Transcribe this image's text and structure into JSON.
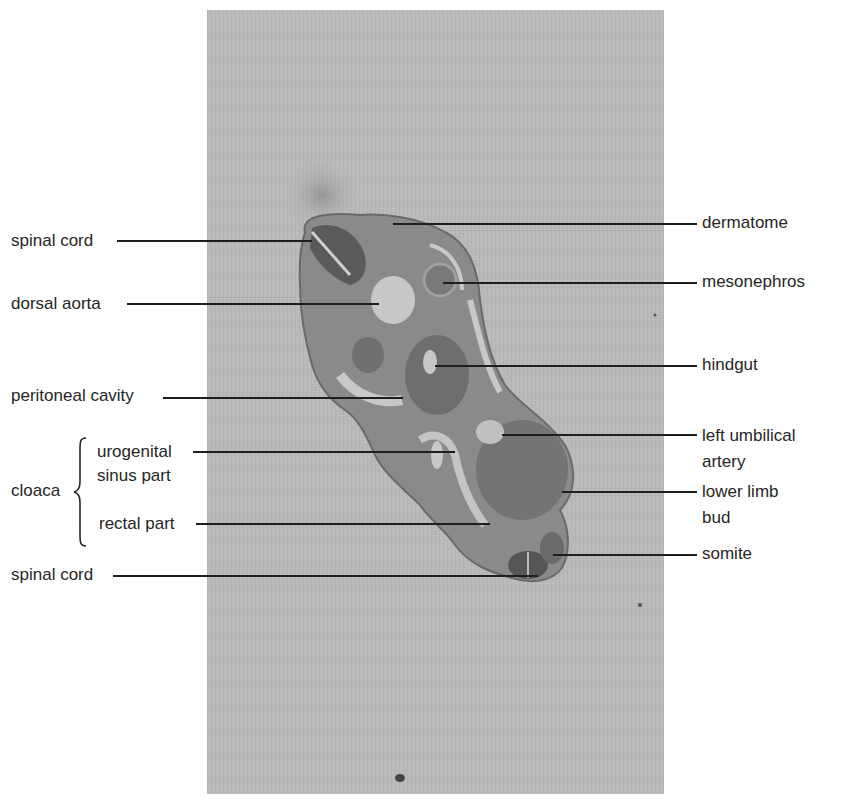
{
  "figure": {
    "type": "labeled histological section",
    "background_color": "#ffffff",
    "panel_color": "#b9b9b9",
    "label_color": "#262626",
    "leader_color": "#1e1e1e"
  },
  "labels_left": [
    {
      "text": "spinal cord",
      "y": 241
    },
    {
      "text": "dorsal aorta",
      "y": 304
    },
    {
      "text": "peritoneal cavity",
      "y": 396
    }
  ],
  "cloaca": {
    "group_label": "cloaca",
    "parts": [
      {
        "line1": "urogenital",
        "line2": "sinus part"
      },
      {
        "line1": "rectal part"
      }
    ]
  },
  "labels_left_bottom": [
    {
      "text": "spinal cord",
      "y": 575
    }
  ],
  "labels_right": [
    {
      "text": "dermatome"
    },
    {
      "text": "mesonephros"
    },
    {
      "text": "hindgut"
    },
    {
      "line1": "left umbilical",
      "line2": "artery"
    },
    {
      "line1": "lower limb",
      "line2": "bud"
    },
    {
      "text": "somite"
    }
  ]
}
